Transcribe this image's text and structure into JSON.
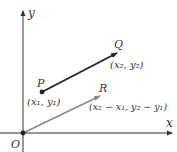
{
  "diagram": {
    "axes": {
      "x_label": "x",
      "y_label": "y",
      "origin_label": "O"
    },
    "points": {
      "P": {
        "label": "P",
        "coords": "(x₁, y₁)"
      },
      "Q": {
        "label": "Q",
        "coords": "(x₂, y₂)"
      },
      "R": {
        "label": "R",
        "coords": "(x₂ − x₁, y₂ − y₁)"
      }
    },
    "vectors": [
      {
        "from": "P",
        "to": "Q",
        "color": "#222222"
      },
      {
        "from": "O",
        "to": "R",
        "color": "#888888"
      }
    ],
    "colors": {
      "axis": "#333333",
      "pq_vector": "#222222",
      "or_vector": "#888888",
      "text": "#333333"
    }
  }
}
